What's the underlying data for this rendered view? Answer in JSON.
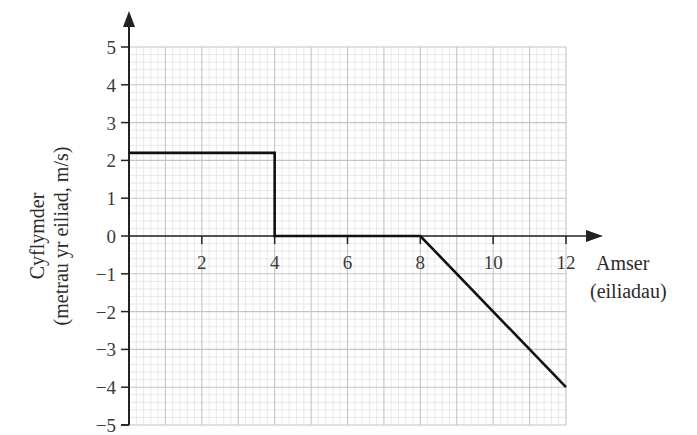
{
  "chart_data": {
    "type": "line",
    "title": "",
    "xlabel": "Amser",
    "xlabel_sub": "(eiliadau)",
    "ylabel": "Cyflymder",
    "ylabel_sub": "(metrau yr eiliad, m/s)",
    "xlim": [
      0,
      12
    ],
    "ylim": [
      -5,
      5
    ],
    "x_ticks": [
      2,
      4,
      6,
      8,
      10,
      12
    ],
    "x_tick_labels": [
      "2",
      "4",
      "6",
      "8",
      "10",
      "12"
    ],
    "y_ticks": [
      5,
      4,
      3,
      2,
      1,
      0,
      -1,
      -2,
      -3,
      -4,
      -5
    ],
    "y_tick_labels": [
      "5",
      "4",
      "3",
      "2",
      "1",
      "0",
      "−1",
      "−2",
      "−3",
      "−4",
      "−5"
    ],
    "grid": true,
    "grid_minor_step": 0.2,
    "grid_major_step": 1,
    "legend": null,
    "series": [
      {
        "name": "velocity",
        "x": [
          0,
          4,
          4,
          8,
          12
        ],
        "y": [
          2.2,
          2.2,
          0,
          0,
          -4
        ]
      }
    ]
  },
  "colors": {
    "line": "#111111",
    "axis": "#222222",
    "grid_major": "#c4c4c4",
    "grid_minor": "#e2e2e2"
  }
}
